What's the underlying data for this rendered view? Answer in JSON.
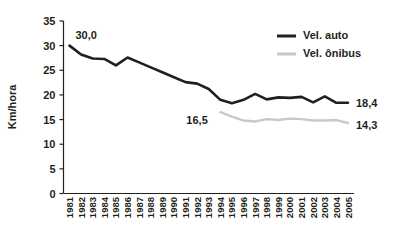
{
  "chart_data": {
    "type": "line",
    "title": "",
    "xlabel": "",
    "ylabel": "Km/hora",
    "ylim": [
      0,
      35
    ],
    "ytick_step": 5,
    "grid": false,
    "legend_position": "top-right",
    "x": [
      "1981",
      "1982",
      "1983",
      "1984",
      "1985",
      "1986",
      "1987",
      "1988",
      "1989",
      "1990",
      "1991",
      "1992",
      "1993",
      "1994",
      "1995",
      "1996",
      "1997",
      "1998",
      "1999",
      "2000",
      "2001",
      "2002",
      "2003",
      "2004",
      "2005"
    ],
    "yticks": [
      "0",
      "5",
      "10",
      "15",
      "20",
      "25",
      "30",
      "35"
    ],
    "series": [
      {
        "name": "Vel. auto",
        "color": "#231f20",
        "width": 2.6,
        "x": [
          "1981",
          "1982",
          "1983",
          "1984",
          "1985",
          "1986",
          "1987",
          "1988",
          "1989",
          "1990",
          "1991",
          "1992",
          "1993",
          "1994",
          "1995",
          "1996",
          "1997",
          "1998",
          "1999",
          "2000",
          "2001",
          "2002",
          "2003",
          "2004",
          "2005"
        ],
        "values": [
          30.0,
          28.2,
          27.4,
          27.3,
          26.0,
          27.6,
          26.6,
          25.6,
          24.6,
          23.6,
          22.6,
          22.3,
          21.2,
          19.0,
          18.3,
          19.0,
          20.2,
          19.1,
          19.5,
          19.4,
          19.6,
          18.5,
          19.7,
          18.4,
          18.4
        ]
      },
      {
        "name": "Vel. ônibus",
        "color": "#c9c9c9",
        "width": 2.4,
        "x": [
          "1994",
          "1995",
          "1996",
          "1997",
          "1998",
          "1999",
          "2000",
          "2001",
          "2002",
          "2003",
          "2004",
          "2005"
        ],
        "values": [
          16.5,
          15.6,
          14.8,
          14.6,
          15.1,
          14.9,
          15.2,
          15.1,
          14.8,
          14.8,
          14.9,
          14.3
        ]
      }
    ],
    "annotations": [
      {
        "text": "30,0",
        "series": "Vel. auto",
        "x": "1981",
        "value": 30.0,
        "dx": 6,
        "dy": -7
      },
      {
        "text": "18,4",
        "series": "Vel. auto",
        "x": "2005",
        "value": 18.4,
        "dx": 8,
        "dy": 4
      },
      {
        "text": "16,5",
        "series": "Vel. ônibus",
        "x": "1994",
        "value": 16.5,
        "dx": -34,
        "dy": 12
      },
      {
        "text": "14,3",
        "series": "Vel. ônibus",
        "x": "2005",
        "value": 14.3,
        "dx": 8,
        "dy": 6
      }
    ],
    "legend": [
      {
        "label": "Vel. auto",
        "color": "#231f20",
        "width": 3.0
      },
      {
        "label": "Vel. ônibus",
        "color": "#c9c9c9",
        "width": 3.0
      }
    ]
  }
}
